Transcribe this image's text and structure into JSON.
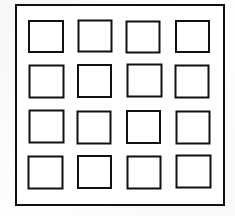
{
  "figure": {
    "name": "grid-of-squares",
    "background_color": "#fefefe",
    "line_color": "#111111",
    "fill_color": "#ffffff",
    "canvas": {
      "width": 235,
      "height": 216
    },
    "outer_frame": {
      "x": 15,
      "y": 4,
      "width": 210,
      "height": 202,
      "border_width": 2
    },
    "grid": {
      "rows": 4,
      "columns": 4,
      "cell_count": 16,
      "cell_width": 35,
      "cell_height": 34,
      "cell_border_width": 2,
      "column_x": [
        28,
        77,
        126,
        175
      ],
      "row_y": [
        20,
        64,
        110,
        155
      ],
      "column_pitch": 49,
      "row_pitch": 45
    },
    "cells": [
      {
        "id": "cell-r1-c1",
        "row": 1,
        "col": 1,
        "x": 28,
        "y": 20,
        "w": 36,
        "h": 33,
        "jitter": "jit-a"
      },
      {
        "id": "cell-r1-c2",
        "row": 1,
        "col": 2,
        "x": 77,
        "y": 20,
        "w": 35,
        "h": 33,
        "jitter": "jit-b"
      },
      {
        "id": "cell-r1-c3",
        "row": 1,
        "col": 3,
        "x": 126,
        "y": 20,
        "w": 35,
        "h": 33,
        "jitter": "jit-c"
      },
      {
        "id": "cell-r1-c4",
        "row": 1,
        "col": 4,
        "x": 175,
        "y": 20,
        "w": 35,
        "h": 33,
        "jitter": "jit-a"
      },
      {
        "id": "cell-r2-c1",
        "row": 2,
        "col": 1,
        "x": 28,
        "y": 64,
        "w": 36,
        "h": 34,
        "jitter": "jit-d"
      },
      {
        "id": "cell-r2-c2",
        "row": 2,
        "col": 2,
        "x": 77,
        "y": 64,
        "w": 35,
        "h": 34,
        "jitter": "jit-a"
      },
      {
        "id": "cell-r2-c3",
        "row": 2,
        "col": 3,
        "x": 126,
        "y": 64,
        "w": 36,
        "h": 34,
        "jitter": "jit-b"
      },
      {
        "id": "cell-r2-c4",
        "row": 2,
        "col": 4,
        "x": 175,
        "y": 64,
        "w": 35,
        "h": 34,
        "jitter": "jit-c"
      },
      {
        "id": "cell-r3-c1",
        "row": 3,
        "col": 1,
        "x": 28,
        "y": 110,
        "w": 36,
        "h": 34,
        "jitter": "jit-b"
      },
      {
        "id": "cell-r3-c2",
        "row": 3,
        "col": 2,
        "x": 77,
        "y": 110,
        "w": 35,
        "h": 34,
        "jitter": "jit-c"
      },
      {
        "id": "cell-r3-c3",
        "row": 3,
        "col": 3,
        "x": 126,
        "y": 110,
        "w": 35,
        "h": 34,
        "jitter": "jit-a"
      },
      {
        "id": "cell-r3-c4",
        "row": 3,
        "col": 4,
        "x": 175,
        "y": 110,
        "w": 35,
        "h": 34,
        "jitter": "jit-d"
      },
      {
        "id": "cell-r4-c1",
        "row": 4,
        "col": 1,
        "x": 28,
        "y": 155,
        "w": 36,
        "h": 34,
        "jitter": "jit-c"
      },
      {
        "id": "cell-r4-c2",
        "row": 4,
        "col": 2,
        "x": 77,
        "y": 155,
        "w": 35,
        "h": 34,
        "jitter": "jit-a"
      },
      {
        "id": "cell-r4-c3",
        "row": 4,
        "col": 3,
        "x": 126,
        "y": 155,
        "w": 35,
        "h": 34,
        "jitter": "jit-d"
      },
      {
        "id": "cell-r4-c4",
        "row": 4,
        "col": 4,
        "x": 175,
        "y": 155,
        "w": 36,
        "h": 34,
        "jitter": "jit-b"
      }
    ]
  }
}
